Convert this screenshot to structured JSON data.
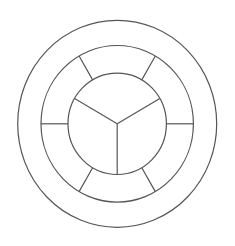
{
  "diagram": {
    "type": "concentric-ring-wheel",
    "background": "#ffffff",
    "stroke_color": "#555555",
    "stroke_width": 1.2,
    "center": {
      "x": 117.2,
      "y": 123.8
    },
    "rings": [
      {
        "name": "outer",
        "rx": 99.5,
        "ry": 103.5
      },
      {
        "name": "middle",
        "rx": 76.2,
        "ry": 78.3
      },
      {
        "name": "inner",
        "rx": 49.2,
        "ry": 50.7
      }
    ],
    "middle_ring_segments": 6,
    "middle_ring_spoke_angles_deg": [
      0,
      60,
      120,
      180,
      240,
      300
    ],
    "inner_circle_sectors": 3,
    "inner_spoke_angles_deg": [
      30,
      150,
      270
    ]
  }
}
